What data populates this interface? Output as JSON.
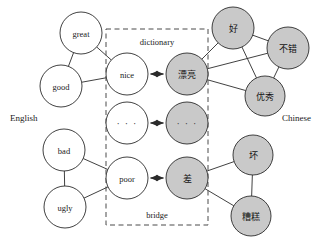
{
  "figure": {
    "title": "",
    "left_axis_label": "English",
    "right_axis_label": "Chinese",
    "box_top_label": "dictionary",
    "box_bottom_label": "bridge",
    "colors": {
      "english_node_fill": "#ffffff",
      "chinese_node_fill": "#c9c9c9",
      "stroke": "#2b2b2b",
      "dashed_box_stroke": "#4a4a4a",
      "background": "#ffffff"
    }
  },
  "nodes": {
    "great": {
      "label": "great",
      "lang": "en",
      "cx": 81,
      "cy": 33,
      "r": 21
    },
    "good": {
      "label": "good",
      "lang": "en",
      "cx": 61,
      "cy": 86,
      "r": 21
    },
    "nice": {
      "label": "nice",
      "lang": "en",
      "cx": 127,
      "cy": 74,
      "r": 21
    },
    "dots_en": {
      "label": "· · ·",
      "lang": "en",
      "cx": 127,
      "cy": 123,
      "r": 21
    },
    "poor": {
      "label": "poor",
      "lang": "en",
      "cx": 127,
      "cy": 178,
      "r": 21
    },
    "bad": {
      "label": "bad",
      "lang": "en",
      "cx": 64,
      "cy": 150,
      "r": 21
    },
    "ugly": {
      "label": "ugly",
      "lang": "en",
      "cx": 65,
      "cy": 207,
      "r": 21
    },
    "piaoliang": {
      "label": "漂亮",
      "lang": "zh",
      "cx": 187,
      "cy": 74,
      "r": 21
    },
    "dots_zh": {
      "label": "· · ·",
      "lang": "zh",
      "cx": 187,
      "cy": 123,
      "r": 21
    },
    "cha": {
      "label": "差",
      "lang": "zh",
      "cx": 187,
      "cy": 178,
      "r": 21
    },
    "hao": {
      "label": "好",
      "lang": "zh",
      "cx": 233,
      "cy": 28,
      "r": 21
    },
    "bucuo": {
      "label": "不错",
      "lang": "zh",
      "cx": 288,
      "cy": 48,
      "r": 21
    },
    "youxiu": {
      "label": "优秀",
      "lang": "zh",
      "cx": 265,
      "cy": 96,
      "r": 20
    },
    "huai": {
      "label": "坏",
      "lang": "zh",
      "cx": 253,
      "cy": 155,
      "r": 20
    },
    "zaogao": {
      "label": "糟糕",
      "lang": "zh",
      "cx": 251,
      "cy": 216,
      "r": 20
    }
  },
  "edges": [
    {
      "from": "great",
      "to": "good"
    },
    {
      "from": "great",
      "to": "nice"
    },
    {
      "from": "good",
      "to": "nice"
    },
    {
      "from": "bad",
      "to": "ugly"
    },
    {
      "from": "bad",
      "to": "poor"
    },
    {
      "from": "ugly",
      "to": "poor"
    },
    {
      "from": "piaoliang",
      "to": "hao"
    },
    {
      "from": "piaoliang",
      "to": "bucuo"
    },
    {
      "from": "piaoliang",
      "to": "youxiu"
    },
    {
      "from": "hao",
      "to": "bucuo"
    },
    {
      "from": "hao",
      "to": "youxiu"
    },
    {
      "from": "bucuo",
      "to": "youxiu"
    },
    {
      "from": "cha",
      "to": "huai"
    },
    {
      "from": "cha",
      "to": "zaogao"
    },
    {
      "from": "huai",
      "to": "zaogao"
    }
  ],
  "bridges": [
    {
      "from": "nice",
      "to": "piaoliang"
    },
    {
      "from": "dots_en",
      "to": "dots_zh"
    },
    {
      "from": "poor",
      "to": "cha"
    }
  ],
  "dashed_box": {
    "x": 106,
    "y": 29,
    "width": 102,
    "height": 196
  },
  "side_labels": {
    "english": {
      "text": "English",
      "x": 10,
      "y": 118
    },
    "chinese": {
      "text": "Chinese",
      "x": 282,
      "y": 118
    }
  },
  "box_labels": {
    "dictionary": {
      "text": "dictionary",
      "x": 157,
      "y": 42
    },
    "bridge": {
      "text": "bridge",
      "x": 157,
      "y": 215
    }
  }
}
